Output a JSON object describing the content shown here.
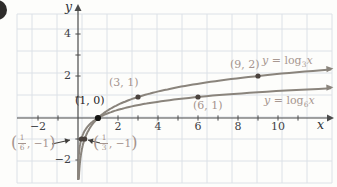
{
  "labels": {
    "y_axis": "y",
    "x_axis": "x",
    "fn3": {
      "y": "y",
      "mid": " = log",
      "sub": "3",
      "x": "x"
    },
    "fn6": {
      "y": "y",
      "mid": " = log",
      "sub": "6",
      "x": "x"
    },
    "frac16": {
      "open": "(",
      "num": "1",
      "den": "6",
      "rest": ", −1",
      "close": ")"
    },
    "frac13": {
      "open": "(",
      "num": "1",
      "den": "3",
      "rest": ", −1",
      "close": ")"
    }
  },
  "chart_data": {
    "type": "line",
    "grid": true,
    "x_range": [
      -3,
      12.7
    ],
    "y_range": [
      -3,
      5.3
    ],
    "x_ticks": [
      -2,
      -1,
      1,
      2,
      3,
      4,
      5,
      6,
      7,
      8,
      9,
      10,
      11
    ],
    "y_ticks": [
      -2,
      -1,
      1,
      2,
      3,
      4
    ],
    "x_tick_labels": [
      {
        "v": -2,
        "t": "−2"
      },
      {
        "v": 2,
        "t": "2"
      },
      {
        "v": 4,
        "t": "4"
      },
      {
        "v": 6,
        "t": "6"
      },
      {
        "v": 8,
        "t": "8"
      },
      {
        "v": 10,
        "t": "10"
      }
    ],
    "y_tick_labels": [
      {
        "v": -2,
        "t": "−2"
      },
      {
        "v": 2,
        "t": "2"
      },
      {
        "v": 4,
        "t": "4"
      }
    ],
    "series": [
      {
        "name": "y = log3(x)",
        "base": 3,
        "marked_points": [
          {
            "x": 1,
            "y": 0,
            "label": "(1, 0)",
            "emph": true
          },
          {
            "x": 3,
            "y": 1,
            "label": "(3, 1)"
          },
          {
            "x": 9,
            "y": 2,
            "label": "(9, 2)"
          },
          {
            "x": 0.3333,
            "y": -1,
            "label": "(1/3, −1)"
          }
        ]
      },
      {
        "name": "y = log6(x)",
        "base": 6,
        "marked_points": [
          {
            "x": 6,
            "y": 1,
            "label": "(6, 1)"
          },
          {
            "x": 0.1667,
            "y": -1,
            "label": "(1/6, −1)"
          }
        ]
      }
    ],
    "layout": {
      "ox": 78,
      "oy": 118,
      "ux": 20,
      "uy": 21,
      "x_end": 12.62,
      "y_min": -2.9,
      "grid_px": {
        "x_lines_start": 32,
        "x_left_edge": 17,
        "x_lines_end": 332,
        "sx": 25,
        "y_lines_start": 29,
        "y_top_edge": 14,
        "y_lines_end": 183,
        "sy": 22
      },
      "axis_px": {
        "x0": 17,
        "x1": 331,
        "x_tip": 334,
        "y_bottom": 180,
        "y_top": 8,
        "y_tip": 4
      },
      "annotation_arrows": [
        {
          "from": [
            52,
            144
          ],
          "to": [
            70,
            140
          ]
        },
        {
          "from": [
            100,
            143
          ],
          "to": [
            88,
            140
          ]
        }
      ]
    }
  },
  "colors": {
    "curve": "#8a847c",
    "point_dot": "#4a423d",
    "origin_dot": "#151513",
    "point_label": "#a5948e",
    "fn_label": "#a89891",
    "axis": "#4b4b4b",
    "tick_text": "#3d4145",
    "grid": "#dce1e7",
    "annotation": "#3f3d3a",
    "badge": "#2e2c2b"
  }
}
